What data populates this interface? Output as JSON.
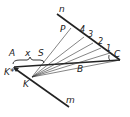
{
  "diagram": {
    "labels": {
      "n": "n",
      "m": "m",
      "P": "P",
      "n4": "4",
      "n3": "3",
      "n2": "2",
      "n1": "1",
      "C": "C",
      "A": "A",
      "x": "x",
      "S": "S",
      "Kstar": "K*",
      "K": "K",
      "B": "B"
    },
    "colors": {
      "stroke": "#222222",
      "background": "#ffffff"
    }
  }
}
